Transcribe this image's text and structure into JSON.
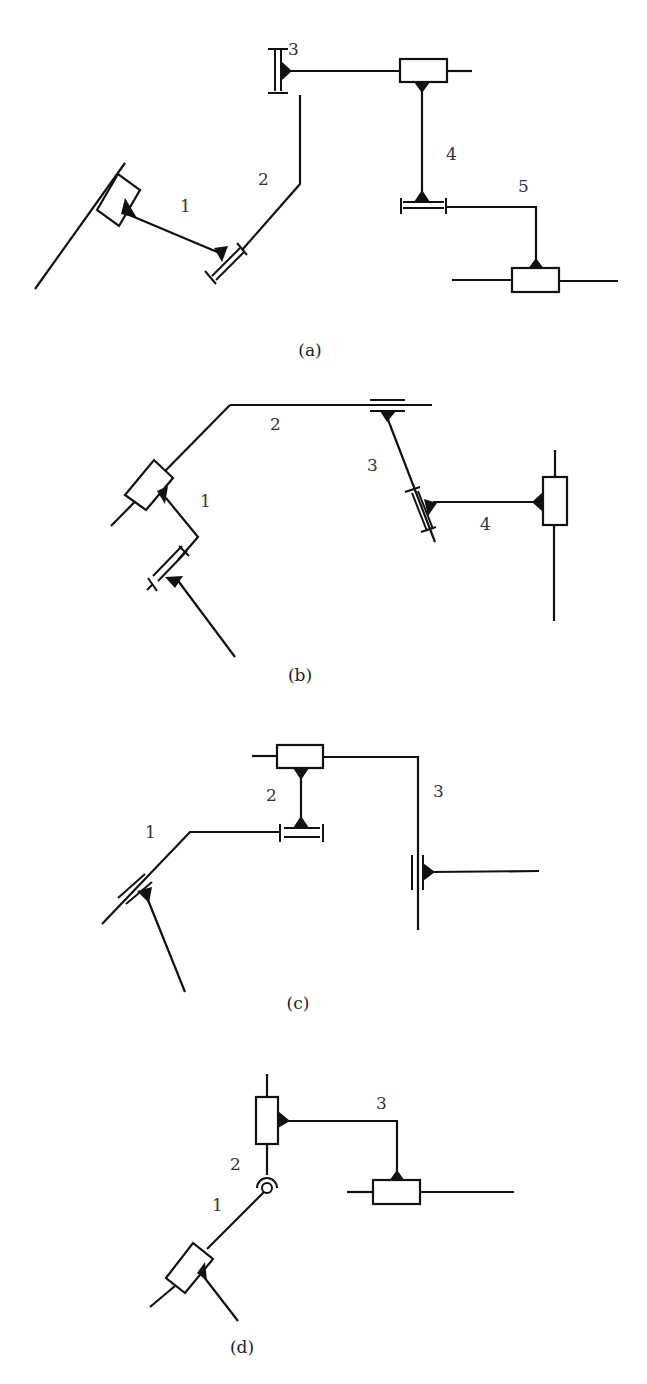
{
  "figure": {
    "panels": [
      {
        "id": "a",
        "caption": "(a)",
        "link_labels": [
          "1",
          "2",
          "3",
          "4",
          "5"
        ],
        "joints": [
          "prismatic-slider",
          "prismatic-sleeve",
          "prismatic-sleeve",
          "prismatic-slider",
          "prismatic-sleeve",
          "prismatic-slider"
        ]
      },
      {
        "id": "b",
        "caption": "(b)",
        "link_labels": [
          "1",
          "2",
          "3",
          "4"
        ],
        "joints": [
          "prismatic-sleeve",
          "prismatic-slider",
          "prismatic-guide",
          "prismatic-sleeve",
          "prismatic-slider"
        ]
      },
      {
        "id": "c",
        "caption": "(c)",
        "link_labels": [
          "1",
          "2",
          "3"
        ],
        "joints": [
          "prismatic-guide",
          "prismatic-sleeve",
          "prismatic-slider",
          "prismatic-guide"
        ]
      },
      {
        "id": "d",
        "caption": "(d)",
        "link_labels": [
          "1",
          "2",
          "3"
        ],
        "joints": [
          "prismatic-slider",
          "revolute",
          "prismatic-slider",
          "prismatic-slider"
        ]
      }
    ],
    "footer_caption_clipped": ""
  }
}
